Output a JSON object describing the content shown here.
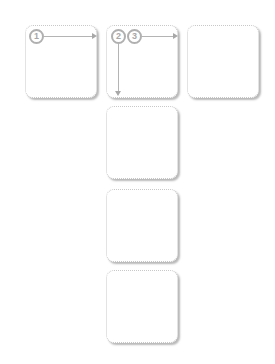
{
  "diagram": {
    "tiles": [
      {
        "id": 1,
        "x": 25,
        "y": 25
      },
      {
        "id": 2,
        "x": 106,
        "y": 25
      },
      {
        "id": 3,
        "x": 187,
        "y": 25
      },
      {
        "id": 4,
        "x": 106,
        "y": 106
      },
      {
        "id": 5,
        "x": 106,
        "y": 189
      },
      {
        "id": 6,
        "x": 106,
        "y": 270
      }
    ],
    "steps": [
      {
        "label": "1",
        "direction": "right"
      },
      {
        "label": "2",
        "direction": "down"
      },
      {
        "label": "3",
        "direction": "right"
      }
    ],
    "colors": {
      "border": "#c8c8c8",
      "badge": "#b0b0b0",
      "arrow": "#b4b4b4"
    }
  }
}
